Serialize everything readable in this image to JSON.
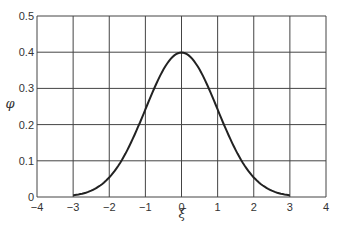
{
  "chart_data": {
    "type": "line",
    "title": "",
    "xlabel": "ξ",
    "ylabel": "φ",
    "xlim": [
      -4,
      4
    ],
    "ylim": [
      0,
      0.5
    ],
    "grid": true,
    "x_ticks": [
      "−4",
      "−3",
      "−2",
      "−1",
      "0",
      "1",
      "2",
      "3",
      "4"
    ],
    "y_ticks": [
      "0",
      "0.1",
      "0.2",
      "0.3",
      "0.4",
      "0.5"
    ],
    "series": [
      {
        "name": "φ(ξ)",
        "x": [
          -3,
          -2.5,
          -2,
          -1.5,
          -1,
          -0.5,
          0,
          0.5,
          1,
          1.5,
          2,
          2.5,
          3
        ],
        "values": [
          0.004,
          0.018,
          0.054,
          0.13,
          0.242,
          0.352,
          0.399,
          0.352,
          0.242,
          0.13,
          0.054,
          0.018,
          0.004
        ]
      }
    ]
  }
}
